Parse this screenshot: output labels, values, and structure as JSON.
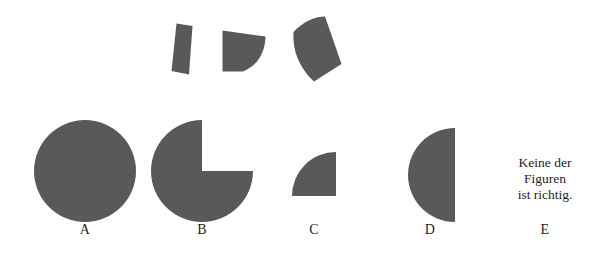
{
  "figure": {
    "kind": "non-verbal-reasoning-puzzle",
    "language": "de",
    "background_color": "#ffffff",
    "shape_fill_color": "#595959",
    "text_color": "#231f20"
  },
  "pieces": {
    "caption": "",
    "items": [
      {
        "id": "piece-1",
        "name": "narrow-sliver-piece",
        "description": "narrow tilted quadrilateral sliver",
        "x": 171,
        "y": 23,
        "width": 22,
        "height": 52
      },
      {
        "id": "piece-2",
        "name": "small-curved-wedge-piece",
        "description": "small wedge with concave lower-left and curved right edge",
        "x": 222,
        "y": 30,
        "width": 44,
        "height": 42
      },
      {
        "id": "piece-3",
        "name": "large-curved-wedge-piece",
        "description": "large curved pie-like wedge",
        "x": 292,
        "y": 16,
        "width": 50,
        "height": 66
      }
    ]
  },
  "options": {
    "items": [
      {
        "id": "option-a",
        "label": "A",
        "shape": "full-circle",
        "cx": 85,
        "cy": 171,
        "r": 51,
        "label_x": 65,
        "label_y": 228
      },
      {
        "id": "option-b",
        "label": "B",
        "shape": "three-quarter-circle-missing-upper-right",
        "cx": 202,
        "cy": 171,
        "r": 51,
        "label_x": 182,
        "label_y": 228
      },
      {
        "id": "option-c",
        "label": "C",
        "shape": "quarter-circle-corner-bottom-right",
        "cx": 336,
        "cy": 196,
        "r": 44,
        "label_x": 294,
        "label_y": 228
      },
      {
        "id": "option-d",
        "label": "D",
        "shape": "half-circle-flat-edge-right",
        "cx": 455,
        "cy": 175,
        "r": 47,
        "label_x": 410,
        "label_y": 228
      },
      {
        "id": "option-e",
        "label": "E",
        "shape": "text-only",
        "label_x": 525,
        "label_y": 228,
        "text_lines": [
          "Keine der",
          "Figuren",
          "ist richtig."
        ],
        "text_x": 485,
        "text_y": 157
      }
    ]
  }
}
